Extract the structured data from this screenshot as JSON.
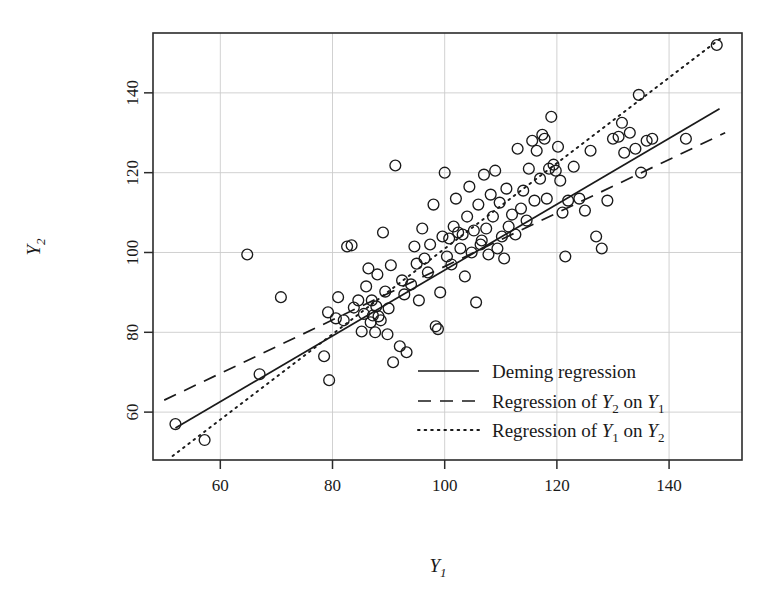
{
  "chart_data": {
    "type": "scatter",
    "title": "",
    "xlabel": "Y_1",
    "ylabel": "Y_2",
    "xlabel_display": "Y",
    "xlabel_sub": "1",
    "ylabel_display": "Y",
    "ylabel_sub": "2",
    "xlim": [
      48,
      153
    ],
    "ylim": [
      48,
      155
    ],
    "xticks": [
      60,
      80,
      100,
      120,
      140
    ],
    "xtick_labels": [
      "60",
      "80",
      "100",
      "120",
      "140"
    ],
    "yticks": [
      60,
      80,
      100,
      120,
      140
    ],
    "ytick_labels": [
      "60",
      "80",
      "100",
      "120",
      "140"
    ],
    "grid": true,
    "grid_color": "#cccccc",
    "marker": "open-circle",
    "marker_color": "#1a1a1a",
    "marker_radius": 5.4,
    "points": [
      [
        52.0,
        57.0
      ],
      [
        57.2,
        53.0
      ],
      [
        64.8,
        99.5
      ],
      [
        67.0,
        69.5
      ],
      [
        70.8,
        88.8
      ],
      [
        78.5,
        74.0
      ],
      [
        79.2,
        85.0
      ],
      [
        79.4,
        68.0
      ],
      [
        80.6,
        83.5
      ],
      [
        81.0,
        88.8
      ],
      [
        82.0,
        83.0
      ],
      [
        82.6,
        101.5
      ],
      [
        83.4,
        101.8
      ],
      [
        83.8,
        86.2
      ],
      [
        84.6,
        88.0
      ],
      [
        85.2,
        80.2
      ],
      [
        85.6,
        84.6
      ],
      [
        86.0,
        91.5
      ],
      [
        86.4,
        96.0
      ],
      [
        86.8,
        82.5
      ],
      [
        87.0,
        88.0
      ],
      [
        87.2,
        84.2
      ],
      [
        87.6,
        80.0
      ],
      [
        87.8,
        86.5
      ],
      [
        88.0,
        94.5
      ],
      [
        88.2,
        84.0
      ],
      [
        88.6,
        83.0
      ],
      [
        89.0,
        105.0
      ],
      [
        89.4,
        90.2
      ],
      [
        89.8,
        79.5
      ],
      [
        90.0,
        86.0
      ],
      [
        90.4,
        96.8
      ],
      [
        90.8,
        72.5
      ],
      [
        91.2,
        121.8
      ],
      [
        92.0,
        76.5
      ],
      [
        92.4,
        93.0
      ],
      [
        92.8,
        89.5
      ],
      [
        93.2,
        75.0
      ],
      [
        94.0,
        92.0
      ],
      [
        94.6,
        101.5
      ],
      [
        95.0,
        97.2
      ],
      [
        95.4,
        88.0
      ],
      [
        96.0,
        106.0
      ],
      [
        96.4,
        98.5
      ],
      [
        97.0,
        95.0
      ],
      [
        97.4,
        102.0
      ],
      [
        98.0,
        112.0
      ],
      [
        98.4,
        81.5
      ],
      [
        98.8,
        80.8
      ],
      [
        99.2,
        90.0
      ],
      [
        99.6,
        104.0
      ],
      [
        100.0,
        120.0
      ],
      [
        100.4,
        99.0
      ],
      [
        100.8,
        103.5
      ],
      [
        101.2,
        97.0
      ],
      [
        101.6,
        106.5
      ],
      [
        102.0,
        113.5
      ],
      [
        102.4,
        105.0
      ],
      [
        102.8,
        101.0
      ],
      [
        103.2,
        104.5
      ],
      [
        103.6,
        94.0
      ],
      [
        104.0,
        109.0
      ],
      [
        104.4,
        116.5
      ],
      [
        104.8,
        100.0
      ],
      [
        105.2,
        105.5
      ],
      [
        105.6,
        87.5
      ],
      [
        106.0,
        112.0
      ],
      [
        106.4,
        102.0
      ],
      [
        106.6,
        103.0
      ],
      [
        107.0,
        119.5
      ],
      [
        107.4,
        106.0
      ],
      [
        107.8,
        99.5
      ],
      [
        108.2,
        114.5
      ],
      [
        108.6,
        109.0
      ],
      [
        109.0,
        120.5
      ],
      [
        109.4,
        101.0
      ],
      [
        109.8,
        112.5
      ],
      [
        110.2,
        104.0
      ],
      [
        110.6,
        98.5
      ],
      [
        111.0,
        116.0
      ],
      [
        111.4,
        106.5
      ],
      [
        112.0,
        109.5
      ],
      [
        112.6,
        104.5
      ],
      [
        113.0,
        126.0
      ],
      [
        113.6,
        111.0
      ],
      [
        114.0,
        115.5
      ],
      [
        114.6,
        108.0
      ],
      [
        115.0,
        121.0
      ],
      [
        115.6,
        128.0
      ],
      [
        116.0,
        113.0
      ],
      [
        116.4,
        125.5
      ],
      [
        117.0,
        118.5
      ],
      [
        117.4,
        129.5
      ],
      [
        117.8,
        128.5
      ],
      [
        118.2,
        113.5
      ],
      [
        118.6,
        121.0
      ],
      [
        119.0,
        134.0
      ],
      [
        119.4,
        122.0
      ],
      [
        119.8,
        120.5
      ],
      [
        120.2,
        126.5
      ],
      [
        120.6,
        118.0
      ],
      [
        121.0,
        110.0
      ],
      [
        121.5,
        99.0
      ],
      [
        122.0,
        113.0
      ],
      [
        123.0,
        121.5
      ],
      [
        124.0,
        113.5
      ],
      [
        125.0,
        110.5
      ],
      [
        126.0,
        125.5
      ],
      [
        127.0,
        104.0
      ],
      [
        128.0,
        101.0
      ],
      [
        129.0,
        113.0
      ],
      [
        130.0,
        128.5
      ],
      [
        131.0,
        129.0
      ],
      [
        131.6,
        132.5
      ],
      [
        132.0,
        125.0
      ],
      [
        133.0,
        130.0
      ],
      [
        134.0,
        126.0
      ],
      [
        134.6,
        139.5
      ],
      [
        135.0,
        120.0
      ],
      [
        136.0,
        128.0
      ],
      [
        137.0,
        128.5
      ],
      [
        143.0,
        128.5
      ],
      [
        148.5,
        152.0
      ]
    ],
    "lines": [
      {
        "name": "deming",
        "style": "solid",
        "label": "Deming regression",
        "x1": 52.0,
        "y1": 56.0,
        "x2": 149.0,
        "y2": 136.0
      },
      {
        "name": "y2-on-y1",
        "style": "dashed",
        "label_prefix": "Regression of ",
        "label_var1": "Y",
        "label_sub1": "2",
        "label_mid": " on ",
        "label_var2": "Y",
        "label_sub2": "1",
        "x1": 50.0,
        "y1": 63.0,
        "x2": 150.0,
        "y2": 130.0
      },
      {
        "name": "y1-on-y2",
        "style": "dotted",
        "label_prefix": "Regression of ",
        "label_var1": "Y",
        "label_sub1": "1",
        "label_mid": " on ",
        "label_var2": "Y",
        "label_sub2": "2",
        "x1": 51.5,
        "y1": 49.0,
        "x2": 149.5,
        "y2": 154.0
      }
    ],
    "legend": {
      "position": "bottom-right-inside",
      "entries": [
        {
          "style": "solid",
          "text": "Deming regression"
        },
        {
          "style": "dashed",
          "text": "Regression of Y2 on Y1"
        },
        {
          "style": "dotted",
          "text": "Regression of Y1 on Y2"
        }
      ]
    }
  }
}
